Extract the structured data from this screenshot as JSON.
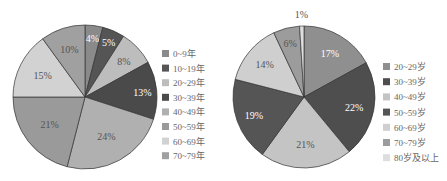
{
  "chart_data": [
    {
      "type": "pie",
      "title": "",
      "categories": [
        "0~9年",
        "10~19年",
        "20~29年",
        "30~39年",
        "40~49年",
        "50~59年",
        "60~69年",
        "70~79年"
      ],
      "values": [
        4,
        5,
        8,
        13,
        24,
        21,
        15,
        10
      ],
      "labels": [
        "4%",
        "5%",
        "8%",
        "13%",
        "24%",
        "21%",
        "15%",
        "10%"
      ],
      "colors": [
        "#8a8a8a",
        "#555555",
        "#bdbdbd",
        "#4a4a4a",
        "#b0b0b0",
        "#9a9a9a",
        "#d2d2d2",
        "#a0a0a0"
      ],
      "label_colors": [
        "#ffffff",
        "#ffffff",
        "#555555",
        "#ffffff",
        "#555555",
        "#555555",
        "#555555",
        "#555555"
      ],
      "legend_position": "right",
      "start_angle_deg": 0,
      "direction": "clockwise"
    },
    {
      "type": "pie",
      "title": "",
      "categories": [
        "20~29岁",
        "30~39岁",
        "40~49岁",
        "50~59岁",
        "60~69岁",
        "70~79岁",
        "80岁及以上"
      ],
      "values": [
        17,
        22,
        21,
        19,
        14,
        6,
        1
      ],
      "labels": [
        "17%",
        "22%",
        "21%",
        "19%",
        "14%",
        "6%",
        "1%"
      ],
      "colors": [
        "#8f8f8f",
        "#4e4e4e",
        "#c4c4c4",
        "#555555",
        "#cfcfcf",
        "#9c9c9c",
        "#dedede"
      ],
      "label_colors": [
        "#ffffff",
        "#ffffff",
        "#555555",
        "#ffffff",
        "#555555",
        "#555555",
        "#555555"
      ],
      "legend_position": "right",
      "start_angle_deg": 0,
      "direction": "clockwise"
    }
  ]
}
